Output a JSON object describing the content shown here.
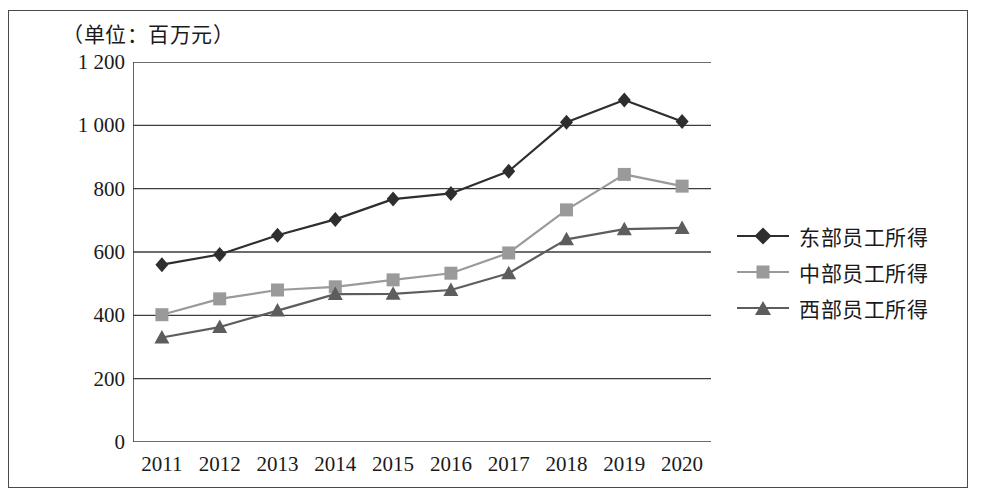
{
  "figure": {
    "unit_label": "（单位：百万元）"
  },
  "chart_data": {
    "type": "line",
    "title": "",
    "subtitle": "",
    "unit_note": "（单位：百万元）",
    "xlabel": "",
    "ylabel": "",
    "categories": [
      "2011",
      "2012",
      "2013",
      "2014",
      "2015",
      "2016",
      "2017",
      "2018",
      "2019",
      "2020"
    ],
    "x": [
      2011,
      2012,
      2013,
      2014,
      2015,
      2016,
      2017,
      2018,
      2019,
      2020
    ],
    "ylim": [
      0,
      1200
    ],
    "yticks": [
      0,
      200,
      400,
      600,
      800,
      1000,
      1200
    ],
    "ytick_labels": [
      "0",
      "200",
      "400",
      "600",
      "800",
      "1 000",
      "1 200"
    ],
    "grid": "horizontal",
    "legend_position": "right",
    "series": [
      {
        "name": "东部员工所得",
        "marker": "diamond",
        "color": "#2e2e2e",
        "values": [
          560,
          592,
          653,
          703,
          767,
          785,
          855,
          1010,
          1080,
          1012
        ]
      },
      {
        "name": "中部员工所得",
        "marker": "square",
        "color": "#9a9a9a",
        "values": [
          402,
          452,
          480,
          490,
          512,
          533,
          597,
          733,
          845,
          808
        ]
      },
      {
        "name": "西部员工所得",
        "marker": "triangle",
        "color": "#5d5d5d",
        "values": [
          330,
          363,
          415,
          467,
          468,
          480,
          533,
          640,
          672,
          676
        ]
      }
    ]
  }
}
